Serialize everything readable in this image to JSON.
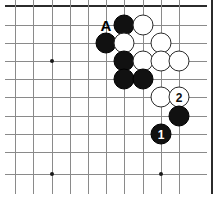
{
  "diagram": {
    "type": "go-board-problem",
    "board_region": "lower-left corner section of a go board",
    "grid": {
      "columns_x": [
        15,
        33,
        52,
        70,
        88,
        106,
        124,
        143,
        161,
        179,
        197
      ],
      "rows_y": [
        6,
        25,
        43,
        61,
        79,
        97,
        116,
        134,
        152,
        174
      ],
      "top_edge_thick": true,
      "right_edge_thick": true,
      "line_color": "#8a8a8a",
      "edge_color": "#2b2b2b",
      "background": "#ffffff"
    },
    "star_points": [
      {
        "x": 52,
        "y": 61
      },
      {
        "x": 52,
        "y": 174
      },
      {
        "x": 161,
        "y": 174
      }
    ],
    "stones": [
      {
        "color": "black",
        "x": 124,
        "y": 25,
        "label": ""
      },
      {
        "color": "white",
        "x": 143,
        "y": 25,
        "label": ""
      },
      {
        "color": "black",
        "x": 106,
        "y": 43,
        "label": ""
      },
      {
        "color": "white",
        "x": 124,
        "y": 43,
        "label": ""
      },
      {
        "color": "white",
        "x": 161,
        "y": 43,
        "label": ""
      },
      {
        "color": "black",
        "x": 124,
        "y": 61,
        "label": ""
      },
      {
        "color": "white",
        "x": 143,
        "y": 61,
        "label": ""
      },
      {
        "color": "white",
        "x": 161,
        "y": 61,
        "label": ""
      },
      {
        "color": "white",
        "x": 179,
        "y": 61,
        "label": ""
      },
      {
        "color": "black",
        "x": 124,
        "y": 79,
        "label": ""
      },
      {
        "color": "black",
        "x": 143,
        "y": 79,
        "label": ""
      },
      {
        "color": "white",
        "x": 161,
        "y": 97,
        "label": ""
      },
      {
        "color": "white",
        "x": 179,
        "y": 97,
        "label": "2"
      },
      {
        "color": "black",
        "x": 179,
        "y": 116,
        "label": ""
      },
      {
        "color": "black",
        "x": 161,
        "y": 134,
        "label": "1"
      }
    ],
    "point_labels": [
      {
        "text": "A",
        "x": 106,
        "y": 25
      }
    ],
    "move_numbers": [
      "1",
      "2"
    ],
    "colors": {
      "black_stone": "#111111",
      "white_stone": "#ffffff",
      "stone_outline": "#2a2a2a",
      "grid": "#8a8a8a",
      "border": "#2b2b2b"
    }
  }
}
